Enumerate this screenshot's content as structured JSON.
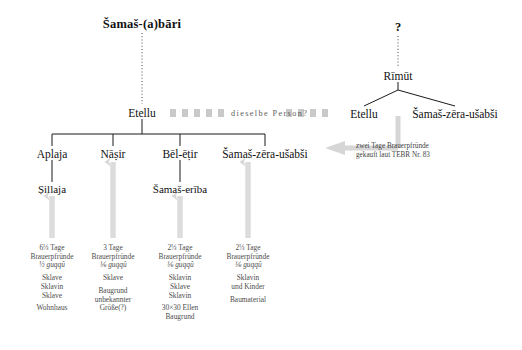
{
  "diagram": {
    "type": "genealogy-tree",
    "root_left": "Šamaš-(a)bāri",
    "root_right": "?",
    "generation2_left": "Etellu",
    "generation2_right": "Rīmūt",
    "link_band_label": "dieselbe Person?",
    "children_left": [
      "Aplaja",
      "Nāṣir",
      "Bēl-ēṭir",
      "Šamaš-zēra-ušabši"
    ],
    "children_right": [
      "Etellu",
      "Šamaš-zēra-ušabši"
    ],
    "grandchildren": [
      "Ṣillaja",
      "Šamaš-erība"
    ],
    "annotation": {
      "line1": "zwei Tage Brauerpfründe",
      "line2": "gekauft laut TEBR Nr. 83"
    },
    "property_blocks": [
      {
        "owner": "Aplaja / Ṣillaja",
        "prebend_amount": "6⅓ Tage",
        "prebend_word": "Brauerpfründe",
        "guqqu": "½ guqqû",
        "items": [
          "Sklave",
          "Sklavin",
          "Sklave"
        ],
        "extra": [
          "Wohnhaus"
        ]
      },
      {
        "owner": "Nāṣir",
        "prebend_amount": "3 Tage",
        "prebend_word": "Brauerpfründe",
        "guqqu": "⅙ guqqû",
        "items": [
          "Sklave"
        ],
        "extra": [
          "Baugrund",
          "unbekannter",
          "Größe(?)"
        ]
      },
      {
        "owner": "Bēl-ēṭir / Šamaš-erība",
        "prebend_amount": "2⅓ Tage",
        "prebend_word": "Brauerpfründe",
        "guqqu": "⅙ guqqû",
        "items": [
          "Sklavin",
          "Sklave",
          "Sklavin"
        ],
        "extra": [
          "30×30 Ellen",
          "Baugrund"
        ]
      },
      {
        "owner": "Šamaš-zēra-ušabši",
        "prebend_amount": "2⅓ Tage",
        "prebend_word": "Brauerpfründe",
        "guqqu": "⅙ guqqû",
        "items": [
          "Sklavin",
          "und Kinder"
        ],
        "extra": [
          "Baumaterial"
        ]
      }
    ],
    "colors": {
      "line": "#1a1a1a",
      "arrow_gray": "#d4d4d4",
      "band_gray": "#c9c9c9",
      "text": "#111111"
    }
  }
}
